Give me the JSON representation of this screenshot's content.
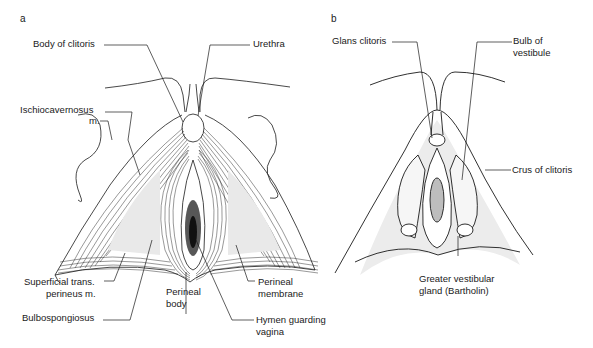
{
  "figure": {
    "panels": [
      {
        "letter": "a",
        "labels": {
          "body_of_clitoris": "Body of clitoris",
          "urethra": "Urethra",
          "ischiocavernosus_1": "Ischiocavernosus",
          "ischiocavernosus_2": "m.",
          "superficial_trans_1": "Superficial trans.",
          "superficial_trans_2": "perineus m.",
          "perineal_body_1": "Perineal",
          "perineal_body_2": "body",
          "perineal_membrane_1": "Perineal",
          "perineal_membrane_2": "membrane",
          "bulbospongiosus": "Bulbospongiosus",
          "hymen_1": "Hymen guarding",
          "hymen_2": "vagina"
        }
      },
      {
        "letter": "b",
        "labels": {
          "glans_clitoris": "Glans clitoris",
          "bulb_1": "Bulb of",
          "bulb_2": "vestibule",
          "crus": "Crus of clitoris",
          "greater_vestibular_1": "Greater vestibular",
          "greater_vestibular_2": "gland (Bartholin)"
        }
      }
    ],
    "colors": {
      "line": "#1a1a1a",
      "stipple": "#d8d8d8",
      "background": "#ffffff"
    }
  }
}
